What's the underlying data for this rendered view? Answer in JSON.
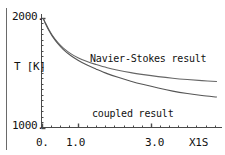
{
  "chart_data": {
    "type": "line",
    "title": "",
    "subtitle": "",
    "xlabel": "X1S",
    "ylabel": "T [K]",
    "xlim": [
      0.0,
      4.95
    ],
    "ylim": [
      1000,
      2000
    ],
    "grid": false,
    "legend_position": "inline-annotations",
    "x_ticks": [
      {
        "value": 0.0,
        "label": "0."
      },
      {
        "value": 1.0,
        "label": "1.0"
      },
      {
        "value": 3.0,
        "label": "3.0"
      }
    ],
    "y_ticks": [
      {
        "value": 2000,
        "label": "2000."
      },
      {
        "value": 1000,
        "label": "1000."
      }
    ],
    "x_minor_tick_step": 0.25,
    "y_minor_tick_step": 50,
    "annotations": [
      {
        "name": "navier-stokes-label",
        "text": "Navier-Stokes result",
        "x": 1.35,
        "y": 1680
      },
      {
        "name": "coupled-label",
        "text": "coupled result",
        "x": 1.4,
        "y": 1190
      }
    ],
    "series": [
      {
        "name": "Navier-Stokes result",
        "color": "#666666",
        "x": [
          0.05,
          0.1,
          0.2,
          0.3,
          0.45,
          0.6,
          0.8,
          1.0,
          1.25,
          1.5,
          1.8,
          2.1,
          2.45,
          2.8,
          3.2,
          3.6,
          4.0,
          4.4,
          4.8
        ],
        "y": [
          1995,
          1960,
          1895,
          1840,
          1775,
          1725,
          1675,
          1638,
          1602,
          1575,
          1546,
          1523,
          1501,
          1483,
          1465,
          1450,
          1438,
          1428,
          1420
        ]
      },
      {
        "name": "coupled result",
        "color": "#555555",
        "x": [
          0.05,
          0.1,
          0.2,
          0.3,
          0.45,
          0.6,
          0.8,
          1.0,
          1.25,
          1.5,
          1.8,
          2.1,
          2.45,
          2.8,
          3.2,
          3.6,
          4.0,
          4.4,
          4.8
        ],
        "y": [
          1993,
          1955,
          1888,
          1832,
          1765,
          1712,
          1658,
          1615,
          1570,
          1533,
          1492,
          1458,
          1423,
          1392,
          1360,
          1332,
          1310,
          1292,
          1278
        ]
      }
    ]
  },
  "axis": {
    "y_top_label": "2000.",
    "y_bottom_label": "1000.",
    "y_axis_title": "T [K]",
    "x_tick_0": "0.",
    "x_tick_1": "1.0",
    "x_tick_3": "3.0",
    "x_axis_title": "X1S"
  },
  "labels": {
    "navier_stokes": "Navier-Stokes result",
    "coupled": "coupled result"
  },
  "colors": {
    "axis": "#4a4a4a",
    "curve": "#5a5a5a",
    "text": "#111111",
    "background": "#ffffff"
  }
}
